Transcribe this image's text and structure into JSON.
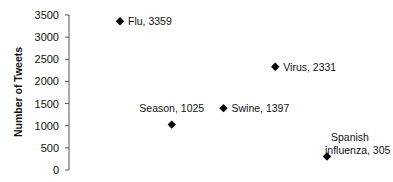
{
  "chart_data": {
    "type": "scatter",
    "title": "",
    "xlabel": "",
    "ylabel": "Number of Tweets",
    "ylim": [
      0,
      3500
    ],
    "yticks": [
      0,
      500,
      1000,
      1500,
      2000,
      2500,
      3000,
      3500
    ],
    "grid": false,
    "legend": null,
    "marker": "diamond",
    "marker_color": "#000000",
    "points": [
      {
        "label": "Flu, 3359",
        "name": "Flu",
        "x": 1,
        "y": 3359
      },
      {
        "label": "Season, 1025",
        "name": "Season",
        "x": 2,
        "y": 1025
      },
      {
        "label": "Swine, 1397",
        "name": "Swine",
        "x": 3,
        "y": 1397
      },
      {
        "label": "Virus, 2331",
        "name": "Virus",
        "x": 4,
        "y": 2331
      },
      {
        "label": "Spanish influenza, 305",
        "name": "Spanish influenza",
        "x": 5,
        "y": 305
      }
    ]
  }
}
